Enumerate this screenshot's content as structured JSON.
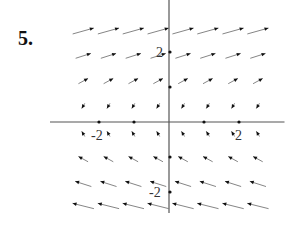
{
  "problem": {
    "number_label": "5."
  },
  "chart_data": {
    "type": "vector_field",
    "title": "",
    "xlabel": "",
    "ylabel": "",
    "x_tick_labels": [
      "-2",
      "2"
    ],
    "y_tick_labels": [
      "2",
      "-2"
    ],
    "x_ticks": [
      -2,
      -1,
      1,
      2
    ],
    "y_ticks": [
      2,
      1,
      -1,
      -2
    ],
    "xlim": [
      -3.4,
      3.3
    ],
    "ylim": [
      -2.6,
      3.5
    ],
    "grid": false,
    "arrow_columns_x": [
      -2.45,
      -1.73,
      -1.02,
      -0.31,
      0.4,
      1.11,
      1.83,
      2.54
    ],
    "arrow_rows": [
      {
        "y": 2.6,
        "dx": 1.0,
        "dy": 0.28,
        "len": 22
      },
      {
        "y": 1.89,
        "dx": 1.0,
        "dy": 0.32,
        "len": 16
      },
      {
        "y": 1.17,
        "dx": 1.0,
        "dy": 0.55,
        "len": 11
      },
      {
        "y": 0.46,
        "dx": -0.6,
        "dy": -1.0,
        "len": 6
      },
      {
        "y": -0.34,
        "dx": -0.6,
        "dy": 1.0,
        "len": 6
      },
      {
        "y": -1.06,
        "dx": -1.0,
        "dy": 0.55,
        "len": 11
      },
      {
        "y": -1.77,
        "dx": -1.0,
        "dy": 0.32,
        "len": 17
      },
      {
        "y": -2.4,
        "dx": -1.0,
        "dy": 0.25,
        "len": 22
      }
    ],
    "colors": {
      "axis": "#555555",
      "arrow": "#333333",
      "arrow_head": "#111111"
    }
  }
}
